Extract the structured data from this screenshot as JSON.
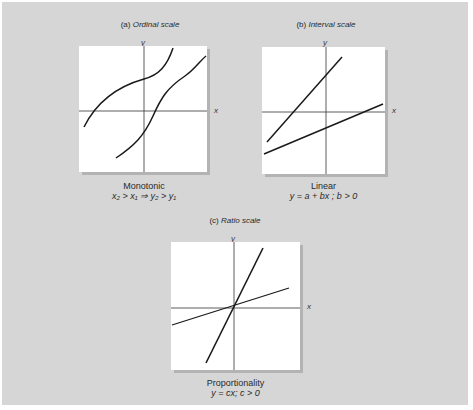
{
  "figures": [
    {
      "id": "a",
      "title_prefix": "(a)",
      "title": "Ordinal scale",
      "x_label": "x",
      "y_label": "y",
      "caption": "Monotonic",
      "formula": "x₂ > x₁ ⇒ y₂ > y₁"
    },
    {
      "id": "b",
      "title_prefix": "(b)",
      "title": "Interval scale",
      "x_label": "x",
      "y_label": "y",
      "caption": "Linear",
      "formula": "y = a + bx ; b > 0"
    },
    {
      "id": "c",
      "title_prefix": "(c)",
      "title": "Ratio scale",
      "x_label": "x",
      "y_label": "y",
      "caption": "Proportionality",
      "formula": "y = cx; c > 0"
    }
  ],
  "colors": {
    "background": "#d6d6d6",
    "plot": "#ffffff",
    "line": "#1a1a1a",
    "axis": "#333333"
  }
}
